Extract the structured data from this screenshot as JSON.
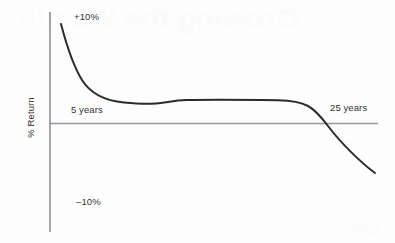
{
  "chart_data": {
    "type": "line",
    "title": "",
    "xlabel": "",
    "ylabel": "% Return",
    "xlim": [
      0,
      30
    ],
    "ylim": [
      -10,
      10
    ],
    "grid": false,
    "legend": null,
    "axis_labels": {
      "y_top": "+10%",
      "y_bottom": "–10%",
      "y_axis_title": "% Return"
    },
    "annotations": [
      {
        "text": "5 years",
        "x": 5,
        "y": 0.8
      },
      {
        "text": "25 years",
        "x": 25,
        "y": 1.2
      }
    ],
    "series": [
      {
        "name": "% Return",
        "x": [
          1.0,
          1.6,
          2.2,
          2.8,
          3.4,
          4.0,
          5.0,
          6.0,
          7.0,
          8.5,
          10.0,
          12.0,
          14.0,
          17.0,
          20.0,
          23.0,
          24.5,
          25.0,
          26.0,
          27.0,
          28.5,
          30.0
        ],
        "values": [
          9.2,
          7.4,
          5.6,
          4.0,
          2.9,
          2.2,
          1.5,
          1.15,
          1.0,
          1.0,
          1.25,
          1.4,
          1.45,
          1.45,
          1.45,
          1.35,
          1.0,
          0.45,
          -1.2,
          -2.6,
          -4.2,
          -5.5
        ]
      }
    ],
    "curve_path": "M 61 24 C 66 43, 72 64, 82 80 C 92 96, 108 101, 124 102.5 C 136 103.6, 146 104.2, 156 103.4 C 166 102.6, 174 100.6, 186 100.1 C 206 99.6, 246 99.8, 278 100.2 C 292 100.4, 300 101.6, 308 106 C 316 110.4, 322 118, 328 126 C 340 142, 360 162, 375 173"
  },
  "figure": {
    "background_color": "#fdfdfd",
    "curve_color": "#2b2b2b",
    "axis_color": "#8d8f93",
    "text_color": "#333437",
    "showthrough_title": "Growing the Wealth",
    "showthrough_footer": "1901"
  }
}
